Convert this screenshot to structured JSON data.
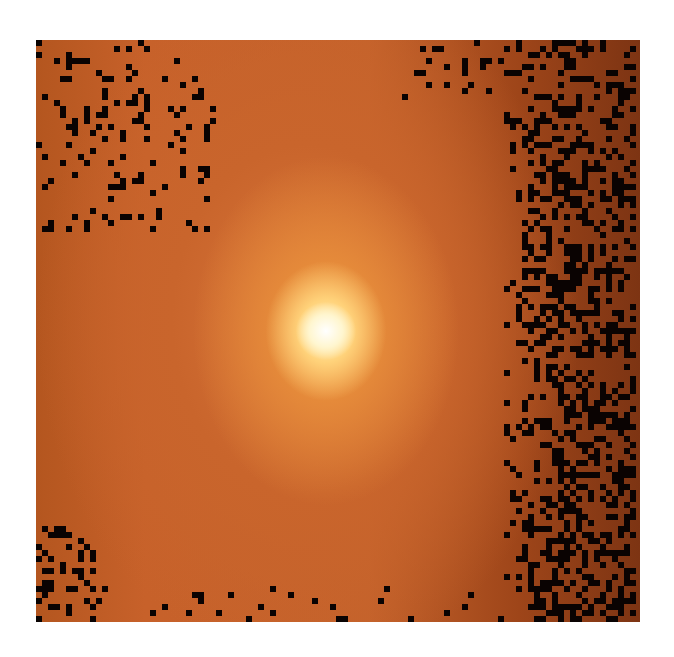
{
  "image": {
    "description": "False-color astronomical image of a galaxy core with bright white-yellow nucleus on orange background, dark noise pixels at edges",
    "colors": {
      "nucleus": "#ffffff",
      "inner_glow": "#ffd27a",
      "halo": "#e58a3a",
      "background": "#b4521f",
      "edge_dark": "#7d3413",
      "noise": "#0a0302"
    },
    "grid": {
      "cols": 100,
      "rows": 97,
      "pixel_size": 6
    },
    "noise": {
      "seed": 7,
      "right_band_start_col": 78,
      "right_density": 0.42,
      "left_top_density": 0.12,
      "corner_bottom_left_density": 0.3,
      "top_edge_density": 0.08,
      "bottom_edge_density": 0.06
    }
  }
}
